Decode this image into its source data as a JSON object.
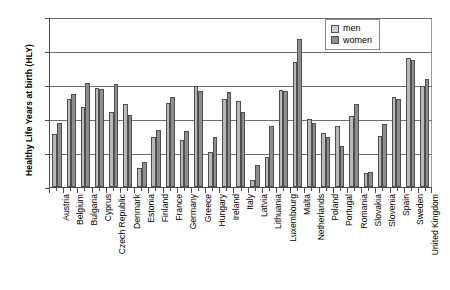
{
  "chart_data": {
    "type": "bar",
    "title": "",
    "xlabel": "",
    "ylabel": "Healthy Life Years at birth (HLY)",
    "ylim": [
      50,
      75
    ],
    "yticks": [
      50,
      55,
      60,
      65,
      70,
      75
    ],
    "grid": true,
    "legend_position": "top-right",
    "categories": [
      "Austria",
      "Belgium",
      "Bulgaria",
      "Cyprus",
      "Czech Republic",
      "Denmark",
      "Estonia",
      "Finland",
      "France",
      "Germany",
      "Greece",
      "Hungary",
      "Ireland",
      "Italy",
      "Latvia",
      "Lithuania",
      "Luxembourg",
      "Malta",
      "Netherlands",
      "Poland",
      "Portugal",
      "Romania",
      "Slovakia",
      "Slovenia",
      "Spain",
      "Sweden",
      "United Kingdom"
    ],
    "series": [
      {
        "name": "men",
        "color": "#b9b9b9",
        "values": [
          57.8,
          63.0,
          61.8,
          64.6,
          61.1,
          62.2,
          52.8,
          57.3,
          62.3,
          56.9,
          64.9,
          55.1,
          63.0,
          62.6,
          51.0,
          54.4,
          64.3,
          68.4,
          60.0,
          58.0,
          58.9,
          60.5,
          52.0,
          57.5,
          63.3,
          69.0,
          64.9
        ],
        "unit": "years"
      },
      {
        "name": "women",
        "color": "#8e8e8e",
        "values": [
          59.4,
          63.7,
          65.3,
          64.4,
          65.1,
          60.6,
          53.7,
          58.4,
          63.2,
          58.3,
          64.1,
          57.3,
          64.0,
          61.0,
          53.2,
          58.9,
          64.1,
          71.8,
          59.4,
          57.3,
          56.0,
          62.2,
          52.2,
          59.3,
          62.9,
          68.7,
          65.9
        ],
        "unit": "years"
      }
    ]
  },
  "legend": {
    "items": [
      {
        "label": "men"
      },
      {
        "label": "women"
      }
    ]
  }
}
